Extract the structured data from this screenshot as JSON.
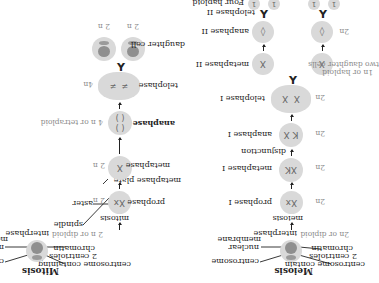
{
  "orientation": "rotated-180",
  "mitosis": {
    "title": "Mitosis",
    "labels": {
      "centrosome_containing": "centrosome containing",
      "two_centrioles": "2 centrioles",
      "chromatin": "chromatin",
      "centrosome": "centrosome",
      "nuclear": "nuclear",
      "membrane": "membrane",
      "interphase": "interphase",
      "interphase_ploidy": "2 n or diploid",
      "mitosis": "mitosis",
      "spindle": "spindle",
      "aster": "aster",
      "prophase": "prophase",
      "prophase_ploidy": "2 n",
      "metaphase_plate": "metaphase plate",
      "metaphase": "metaphase",
      "metaphase_ploidy": "2 n",
      "anaphase": "anaphase",
      "anaphase_ploidy": "4 n or tetraploid",
      "telophase": "telophase",
      "telophase_ploidy": "4n",
      "daughter_cell": "daughter cell",
      "daughter_ploidy_left": "2 n",
      "daughter_ploidy_right": "2 n"
    }
  },
  "meiosis": {
    "title": "Meiosis",
    "labels": {
      "centrosome_contain": "centrosome contain",
      "two_centrioles": "2 centrioles",
      "chromatin": "chromatin",
      "centrosome": "centrosome",
      "nuclear": "nuclear",
      "membrane": "membrane",
      "interphase": "interphase",
      "interphase_ploidy": "2n or diploid",
      "meiosis": "meiosis",
      "prophase1": "prophase I",
      "prophase1_ploidy": "2n",
      "metaphase1": "metaphase I",
      "metaphase1_ploidy": "2n",
      "disjunction": "disjunction",
      "anaphase1": "anaphase I",
      "anaphase1_ploidy": "2n",
      "telophase1": "telophase I",
      "telophase1_ploidy": "2n",
      "metaphase2": "metaphase II",
      "metaphase2_ploidy_1": "1n or haploid",
      "metaphase2_ploidy_2": "two daughter cells",
      "anaphase2": "anaphase II",
      "anaphase2_ploidy": "2n",
      "telophase2": "telophase II",
      "four_haploid": "Four haploid",
      "haploid_cells": [
        "1",
        "1",
        "1",
        "1"
      ]
    }
  },
  "colors": {
    "cell_fill": "#d9d9d9",
    "nucleus_fill": "#8f8f8f",
    "text": "#222222",
    "ploidy_text": "#8a8a8a"
  }
}
